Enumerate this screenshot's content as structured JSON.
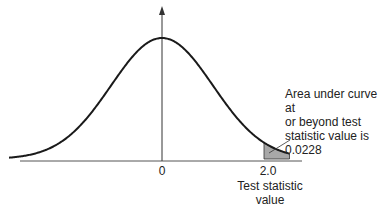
{
  "chart_data": {
    "type": "area",
    "title": "",
    "distribution": "standard normal",
    "xlabel": "",
    "ylabel": "",
    "x_ticks": [
      {
        "value": 0,
        "label": "0"
      },
      {
        "value": 2.0,
        "label": "2.0"
      }
    ],
    "shaded_region": {
      "from": 2.0,
      "to": 2.5,
      "area": 0.0228
    },
    "annotations": {
      "area_note": "Area under curve at\nor beyond test\nstatistic value is\n0.0228",
      "test_statistic_label": "Test statistic\nvalue"
    },
    "xlim": [
      -3.0,
      2.5
    ],
    "grid": false,
    "legend": "none"
  },
  "colors": {
    "curve": "#1a1a1a",
    "axis": "#555555",
    "shade": "#a8a8a8"
  }
}
